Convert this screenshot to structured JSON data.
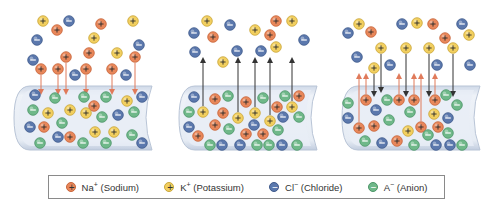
{
  "colors": {
    "Na": {
      "fill": "#e8875a",
      "stroke": "#c8653a",
      "sign": "+"
    },
    "K": {
      "fill": "#f2cf5f",
      "stroke": "#c9a63a",
      "sign": "+"
    },
    "Cl": {
      "fill": "#5b78ad",
      "stroke": "#3f5a8c",
      "sign": "−"
    },
    "A": {
      "fill": "#6fb889",
      "stroke": "#4d9669",
      "sign": "−"
    },
    "tube_fill": "#dfe6f0",
    "tube_stroke": "#b8c4d6",
    "arrow_in": "#e07a5a",
    "arrow_out": "#333333"
  },
  "panels": [
    {
      "offset_x": 0,
      "ions": [
        [
          "K",
          43,
          21
        ],
        [
          "Na",
          57,
          30
        ],
        [
          "Cl",
          69,
          21
        ],
        [
          "Na",
          101,
          24
        ],
        [
          "K",
          133,
          21
        ],
        [
          "Cl",
          37,
          40
        ],
        [
          "K",
          94,
          38
        ],
        [
          "Na",
          89,
          53
        ],
        [
          "K",
          117,
          53
        ],
        [
          "Cl",
          139,
          45
        ],
        [
          "Cl",
          33,
          60
        ],
        [
          "Na",
          66,
          57
        ],
        [
          "Na",
          41,
          69
        ],
        [
          "Na",
          58,
          69
        ],
        [
          "Cl",
          75,
          75
        ],
        [
          "Na",
          86,
          69
        ],
        [
          "Na",
          112,
          69
        ],
        [
          "Cl",
          126,
          75
        ],
        [
          "Na",
          135,
          57
        ],
        [
          "Cl",
          35,
          95
        ],
        [
          "A",
          55,
          98
        ],
        [
          "A",
          84,
          97
        ],
        [
          "A",
          106,
          97
        ],
        [
          "Na",
          94,
          106
        ],
        [
          "K",
          127,
          101
        ],
        [
          "Cl",
          142,
          97
        ],
        [
          "A",
          33,
          110
        ],
        [
          "K",
          48,
          113
        ],
        [
          "K",
          70,
          110
        ],
        [
          "K",
          86,
          113
        ],
        [
          "A",
          102,
          117
        ],
        [
          "Cl",
          118,
          115
        ],
        [
          "A",
          134,
          112
        ],
        [
          "Cl",
          30,
          127
        ],
        [
          "Na",
          44,
          127
        ],
        [
          "A",
          62,
          123
        ],
        [
          "Cl",
          58,
          137
        ],
        [
          "Na",
          70,
          137
        ],
        [
          "K",
          95,
          132
        ],
        [
          "K",
          114,
          132
        ],
        [
          "A",
          132,
          135
        ],
        [
          "A",
          40,
          143
        ],
        [
          "A",
          83,
          143
        ],
        [
          "A",
          106,
          143
        ],
        [
          "Cl",
          142,
          143
        ]
      ],
      "arrows": [
        {
          "x": 41,
          "y1": 75,
          "y2": 92,
          "dir": "in"
        },
        {
          "x": 58,
          "y1": 75,
          "y2": 92,
          "dir": "in"
        },
        {
          "x": 66,
          "y1": 63,
          "y2": 92,
          "dir": "in"
        },
        {
          "x": 86,
          "y1": 75,
          "y2": 92,
          "dir": "in"
        },
        {
          "x": 112,
          "y1": 75,
          "y2": 92,
          "dir": "in"
        },
        {
          "x": 135,
          "y1": 63,
          "y2": 92,
          "dir": "in"
        }
      ]
    },
    {
      "offset_x": 165,
      "ions": [
        [
          "K",
          42,
          21
        ],
        [
          "Cl",
          29,
          33
        ],
        [
          "Na",
          48,
          37
        ],
        [
          "Cl",
          65,
          25
        ],
        [
          "Na",
          111,
          21
        ],
        [
          "K",
          127,
          21
        ],
        [
          "K",
          90,
          30
        ],
        [
          "Na",
          105,
          35
        ],
        [
          "K",
          111,
          47
        ],
        [
          "Cl",
          30,
          52
        ],
        [
          "Cl",
          72,
          51
        ],
        [
          "Cl",
          96,
          51
        ],
        [
          "Cl",
          139,
          40
        ],
        [
          "K",
          58,
          62
        ],
        [
          "Cl",
          29,
          97
        ],
        [
          "Na",
          50,
          99
        ],
        [
          "A",
          63,
          96
        ],
        [
          "Na",
          81,
          102
        ],
        [
          "A",
          98,
          98
        ],
        [
          "A",
          120,
          96
        ],
        [
          "Na",
          134,
          96
        ],
        [
          "A",
          24,
          112
        ],
        [
          "K",
          38,
          112
        ],
        [
          "Na",
          58,
          113
        ],
        [
          "K",
          73,
          118
        ],
        [
          "K",
          90,
          113
        ],
        [
          "Na",
          112,
          107
        ],
        [
          "K",
          127,
          107
        ],
        [
          "A",
          134,
          117
        ],
        [
          "Cl",
          24,
          127
        ],
        [
          "Na",
          50,
          125
        ],
        [
          "A",
          64,
          129
        ],
        [
          "Cl",
          89,
          125
        ],
        [
          "K",
          105,
          121
        ],
        [
          "Cl",
          118,
          117
        ],
        [
          "A",
          113,
          130
        ],
        [
          "Na",
          33,
          136
        ],
        [
          "Na",
          81,
          134
        ],
        [
          "Na",
          98,
          134
        ],
        [
          "A",
          45,
          145
        ],
        [
          "Cl",
          57,
          145
        ],
        [
          "Cl",
          75,
          145
        ],
        [
          "A",
          92,
          145
        ],
        [
          "A",
          104,
          145
        ],
        [
          "Cl",
          117,
          145
        ],
        [
          "A",
          132,
          145
        ]
      ],
      "arrows": [
        {
          "x": 38,
          "y1": 106,
          "y2": 60,
          "dir": "out"
        },
        {
          "x": 73,
          "y1": 112,
          "y2": 60,
          "dir": "out"
        },
        {
          "x": 90,
          "y1": 107,
          "y2": 60,
          "dir": "out"
        },
        {
          "x": 105,
          "y1": 115,
          "y2": 60,
          "dir": "out"
        },
        {
          "x": 127,
          "y1": 101,
          "y2": 60,
          "dir": "out"
        }
      ]
    },
    {
      "offset_x": 328,
      "ions": [
        [
          "K",
          31,
          24
        ],
        [
          "Cl",
          20,
          33
        ],
        [
          "Na",
          43,
          32
        ],
        [
          "Cl",
          74,
          24
        ],
        [
          "K",
          89,
          23
        ],
        [
          "Na",
          105,
          24
        ],
        [
          "Cl",
          134,
          24
        ],
        [
          "Na",
          117,
          38
        ],
        [
          "K",
          141,
          35
        ],
        [
          "K",
          53,
          48
        ],
        [
          "K",
          78,
          48
        ],
        [
          "K",
          101,
          48
        ],
        [
          "K",
          125,
          48
        ],
        [
          "Cl",
          29,
          57
        ],
        [
          "K",
          46,
          68
        ],
        [
          "Cl",
          62,
          65
        ],
        [
          "Cl",
          109,
          65
        ],
        [
          "Cl",
          142,
          65
        ],
        [
          "A",
          20,
          103
        ],
        [
          "Na",
          38,
          100
        ],
        [
          "A",
          59,
          100
        ],
        [
          "Na",
          71,
          100
        ],
        [
          "Na",
          86,
          100
        ],
        [
          "Na",
          107,
          100
        ],
        [
          "A",
          118,
          95
        ],
        [
          "A",
          129,
          105
        ],
        [
          "Cl",
          48,
          110
        ],
        [
          "A",
          82,
          112
        ],
        [
          "K",
          106,
          114
        ],
        [
          "Cl",
          20,
          118
        ],
        [
          "A",
          61,
          120
        ],
        [
          "Cl",
          120,
          118
        ],
        [
          "Na",
          31,
          128
        ],
        [
          "Na",
          46,
          126
        ],
        [
          "K",
          80,
          131
        ],
        [
          "Na",
          93,
          127
        ],
        [
          "Na",
          110,
          127
        ],
        [
          "A",
          100,
          135
        ],
        [
          "A",
          120,
          133
        ],
        [
          "A",
          37,
          141
        ],
        [
          "Cl",
          54,
          143
        ],
        [
          "Na",
          69,
          141
        ],
        [
          "A",
          86,
          145
        ],
        [
          "Cl",
          108,
          145
        ],
        [
          "Cl",
          122,
          145
        ],
        [
          "A",
          134,
          145
        ]
      ],
      "arrows": [
        {
          "x": 31,
          "y1": 122,
          "y2": 76,
          "dir": "in_up"
        },
        {
          "x": 38,
          "y1": 94,
          "y2": 76,
          "dir": "in_up"
        },
        {
          "x": 71,
          "y1": 94,
          "y2": 76,
          "dir": "in_up"
        },
        {
          "x": 86,
          "y1": 94,
          "y2": 76,
          "dir": "in_up"
        },
        {
          "x": 93,
          "y1": 121,
          "y2": 76,
          "dir": "in_up"
        },
        {
          "x": 107,
          "y1": 94,
          "y2": 76,
          "dir": "in_up"
        },
        {
          "x": 46,
          "y1": 74,
          "y2": 94,
          "dir": "down"
        },
        {
          "x": 53,
          "y1": 54,
          "y2": 90,
          "dir": "down"
        },
        {
          "x": 78,
          "y1": 54,
          "y2": 94,
          "dir": "down"
        },
        {
          "x": 101,
          "y1": 54,
          "y2": 94,
          "dir": "down"
        },
        {
          "x": 125,
          "y1": 54,
          "y2": 94,
          "dir": "down"
        }
      ]
    }
  ],
  "legend": {
    "items": [
      {
        "ion": "Na",
        "label": "Na",
        "charge": "+",
        "name": "(Sodium)"
      },
      {
        "ion": "K",
        "label": "K",
        "charge": "+",
        "name": "(Potassium)"
      },
      {
        "ion": "Cl",
        "label": "Cl",
        "charge": "−",
        "name": "(Chloride)"
      },
      {
        "ion": "A",
        "label": "A",
        "charge": "−",
        "name": "(Anion)"
      }
    ]
  }
}
